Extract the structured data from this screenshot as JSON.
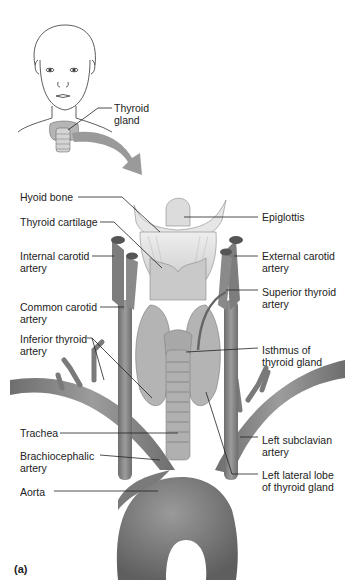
{
  "figure": {
    "panel_label": "(a)",
    "overview": {
      "label": "Thyroid gland"
    },
    "labels_left": [
      {
        "id": "hyoid-bone",
        "text": "Hyoid bone",
        "x": 20,
        "y": 194
      },
      {
        "id": "thyroid-cartilage",
        "text": "Thyroid cartilage",
        "x": 20,
        "y": 219
      },
      {
        "id": "internal-carotid-artery",
        "text": "Internal carotid\nartery",
        "x": 20,
        "y": 250
      },
      {
        "id": "common-carotid-artery",
        "text": "Common carotid\nartery",
        "x": 20,
        "y": 302
      },
      {
        "id": "inferior-thyroid-artery",
        "text": "Inferior thyroid\nartery",
        "x": 20,
        "y": 334
      },
      {
        "id": "trachea",
        "text": "Trachea",
        "x": 20,
        "y": 430
      },
      {
        "id": "brachiocephalic-artery",
        "text": "Brachiocephalic\nartery",
        "x": 20,
        "y": 452
      },
      {
        "id": "aorta",
        "text": "Aorta",
        "x": 20,
        "y": 488
      }
    ],
    "labels_right": [
      {
        "id": "epiglottis",
        "text": "Epiglottis",
        "x": 262,
        "y": 214
      },
      {
        "id": "external-carotid-artery",
        "text": "External carotid\nartery",
        "x": 262,
        "y": 250
      },
      {
        "id": "superior-thyroid-artery",
        "text": "Superior thyroid\nartery",
        "x": 262,
        "y": 287
      },
      {
        "id": "isthmus-of-thyroid-gland",
        "text": "Isthmus of\nthyroid gland",
        "x": 262,
        "y": 346
      },
      {
        "id": "left-subclavian-artery",
        "text": "Left subclavian\nartery",
        "x": 262,
        "y": 434
      },
      {
        "id": "left-lateral-lobe",
        "text": "Left lateral lobe\nof thyroid gland",
        "x": 262,
        "y": 471
      }
    ],
    "colors": {
      "vessel": "#8a8a8a",
      "vessel_dark": "#6d6d6d",
      "gland": "#b8b8b8",
      "cartilage": "#d6d6d6",
      "leader": "#222222",
      "arrow": "#9a9a9a"
    }
  }
}
